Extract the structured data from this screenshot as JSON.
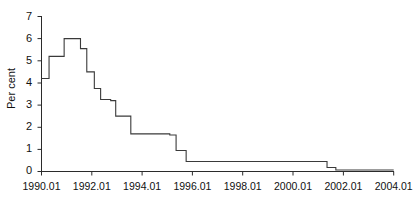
{
  "chart_data": {
    "type": "line",
    "title": "",
    "subtitle": "",
    "xlabel": "",
    "ylabel": "Per cent",
    "legend": [],
    "legend_position": "none",
    "grid": false,
    "line_style": "step-post",
    "line_color": "#3a3a3a",
    "xlim": [
      1990.0,
      2004.0
    ],
    "ylim": [
      0,
      7
    ],
    "yticks": [
      0,
      1,
      2,
      3,
      4,
      5,
      6,
      7
    ],
    "ytick_labels": [
      "0",
      "1",
      "2",
      "3",
      "4",
      "5",
      "6",
      "7"
    ],
    "xticks": [
      1990.01,
      1992.01,
      1994.01,
      1996.01,
      1998.01,
      2000.01,
      2002.01,
      2004.01
    ],
    "xtick_labels": [
      "1990.01",
      "1992.01",
      "1994.01",
      "1996.01",
      "1998.01",
      "2000.01",
      "2002.01",
      "2004.01"
    ],
    "x": [
      1990.0,
      1990.3,
      1990.9,
      1991.4,
      1991.75,
      1992.05,
      1992.3,
      1992.6,
      1992.85,
      1993.1,
      1993.55,
      1993.75,
      1995.1,
      1995.4,
      1995.75,
      2000.95,
      2001.4,
      2001.65,
      2004.0
    ],
    "values": [
      4.2,
      5.2,
      6.0,
      5.55,
      4.5,
      3.75,
      3.25,
      3.2,
      2.5,
      2.45,
      1.7,
      1.7,
      1.65,
      0.95,
      0.45,
      0.45,
      0.18,
      0.07,
      0.07
    ],
    "series": [
      {
        "name": "Per cent",
        "points": [
          {
            "x": 1990.0,
            "y": 4.2
          },
          {
            "x": 1990.3,
            "y": 5.2
          },
          {
            "x": 1990.9,
            "y": 6.0
          },
          {
            "x": 1991.4,
            "y": 6.0
          },
          {
            "x": 1991.55,
            "y": 5.55
          },
          {
            "x": 1991.8,
            "y": 4.5
          },
          {
            "x": 1992.1,
            "y": 3.75
          },
          {
            "x": 1992.35,
            "y": 3.25
          },
          {
            "x": 1992.75,
            "y": 3.2
          },
          {
            "x": 1992.95,
            "y": 2.5
          },
          {
            "x": 1993.55,
            "y": 1.7
          },
          {
            "x": 1995.1,
            "y": 1.65
          },
          {
            "x": 1995.35,
            "y": 0.95
          },
          {
            "x": 1995.75,
            "y": 0.45
          },
          {
            "x": 2000.95,
            "y": 0.45
          },
          {
            "x": 2001.35,
            "y": 0.18
          },
          {
            "x": 2001.7,
            "y": 0.07
          },
          {
            "x": 2004.0,
            "y": 0.07
          }
        ]
      }
    ],
    "annotations": []
  },
  "axis": {
    "y_label": "Per cent",
    "y_ticks": [
      "7",
      "6",
      "5",
      "4",
      "3",
      "2",
      "1",
      "0"
    ],
    "x_ticks": [
      "1990.01",
      "1992.01",
      "1994.01",
      "1996.01",
      "1998.01",
      "2000.01",
      "2002.01",
      "2004.01"
    ]
  },
  "colors": {
    "line": "#3a3a3a",
    "axis": "#2b2b2b",
    "text": "#111111",
    "background": "#ffffff"
  }
}
